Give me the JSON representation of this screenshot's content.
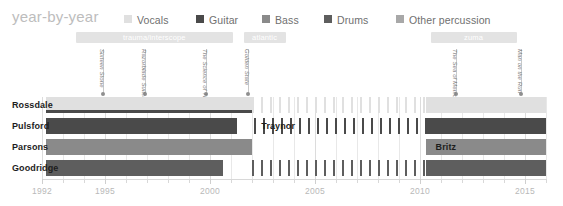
{
  "header": {
    "title": "year-by-year"
  },
  "legend": {
    "items": [
      {
        "label": "Vocals",
        "color": "#e0e0e0",
        "x": 124
      },
      {
        "label": "Guitar",
        "color": "#4a4a4a",
        "x": 196
      },
      {
        "label": "Bass",
        "color": "#8a8a8a",
        "x": 262
      },
      {
        "label": "Drums",
        "color": "#5e5e5e",
        "x": 324
      },
      {
        "label": "Other percussion",
        "color": "#a8a8a8",
        "x": 396
      }
    ]
  },
  "eras": [
    {
      "label": "trauma/interscope",
      "start": 1993.6,
      "end": 2001.1
    },
    {
      "label": "atlantic",
      "start": 2001.6,
      "end": 2003.6
    },
    {
      "label": "zuma",
      "start": 2010.5,
      "end": 2014.6
    }
  ],
  "albums": [
    {
      "name": "Sixteen Stone",
      "year": 1994.9
    },
    {
      "name": "Razorblade Suitcase",
      "year": 1996.9
    },
    {
      "name": "The Science of Things",
      "year": 1999.8
    },
    {
      "name": "Golden State",
      "year": 2001.8
    },
    {
      "name": "The Sea of Memories",
      "year": 2011.7
    },
    {
      "name": "Man on the Run",
      "year": 2014.8
    }
  ],
  "axis": {
    "min": 1992,
    "max": 2016,
    "labels": [
      "1992",
      "1995",
      "2000",
      "2005",
      "2010",
      "2015"
    ],
    "label_years": [
      1992,
      1995,
      2000,
      2005,
      2010,
      2015
    ],
    "tick_step": 1,
    "grid": true
  },
  "chart_data": {
    "type": "bar",
    "title": "year-by-year",
    "xlabel": "",
    "ylabel": "",
    "xlim": [
      1992,
      2016
    ],
    "orientation": "horizontal-timeline",
    "categories": [
      "Rossdale",
      "Pulsford",
      "Parsons",
      "Goodridge"
    ],
    "series": [
      {
        "name": "Rossdale",
        "role": "Vocals",
        "color": "#e0e0e0",
        "secondary_color": "#4a4a4a",
        "segments": [
          {
            "start": 1992.2,
            "end": 2002.0,
            "style": "solid"
          },
          {
            "start": 2002.0,
            "end": 2010.3,
            "style": "striped"
          },
          {
            "start": 2010.3,
            "end": 2016.0,
            "style": "solid"
          }
        ]
      },
      {
        "name": "Pulsford",
        "role": "Guitar",
        "color": "#4a4a4a",
        "segments": [
          {
            "start": 1992.2,
            "end": 2001.3,
            "style": "solid"
          },
          {
            "start": 2002.1,
            "end": 2010.3,
            "style": "striped"
          },
          {
            "start": 2010.3,
            "end": 2016.0,
            "style": "solid"
          }
        ]
      },
      {
        "name": "Parsons",
        "role": "Bass",
        "color": "#8a8a8a",
        "segments": [
          {
            "start": 1992.2,
            "end": 2002.0,
            "style": "solid"
          },
          {
            "start": 2010.3,
            "end": 2016.0,
            "style": "solid"
          }
        ]
      },
      {
        "name": "Goodridge",
        "role": "Drums",
        "color": "#5e5e5e",
        "segments": [
          {
            "start": 1992.2,
            "end": 2000.6,
            "style": "solid"
          },
          {
            "start": 2002.0,
            "end": 2010.3,
            "style": "striped"
          },
          {
            "start": 2010.3,
            "end": 2016.0,
            "style": "solid"
          }
        ]
      }
    ],
    "inline_labels": [
      {
        "text": "Traynor",
        "row": 1,
        "year": 2002.3
      },
      {
        "text": "Britz",
        "row": 2,
        "year": 2010.6
      }
    ]
  }
}
